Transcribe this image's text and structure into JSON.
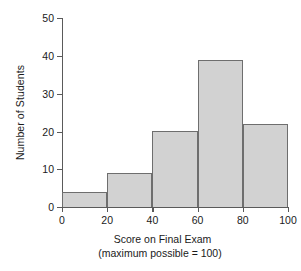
{
  "chart_data": {
    "type": "bar",
    "title": "",
    "subtitle": "",
    "xlabel": "Score on Final Exam",
    "xsublabel": "(maximum possible = 100)",
    "ylabel": "Number of Students",
    "categories": [
      "0-20",
      "20-40",
      "40-60",
      "60-80",
      "80-100"
    ],
    "bin_edges": [
      0,
      20,
      40,
      60,
      80,
      100
    ],
    "values": [
      4,
      9,
      20,
      39,
      22
    ],
    "xlim": [
      0,
      100
    ],
    "ylim": [
      0,
      50
    ],
    "xticks": [
      0,
      20,
      40,
      60,
      80,
      100
    ],
    "yticks": [
      0,
      10,
      20,
      30,
      40,
      50
    ],
    "grid": false,
    "legend": null,
    "bar_fill_color": "#d2d2d2",
    "bar_edge_color": "#6e6e6e",
    "axis_color": "#5a5a5a",
    "background_color": "#ffffff"
  },
  "axis_labels": {
    "y": [
      "50",
      "40",
      "30",
      "20",
      "10",
      "0"
    ],
    "x": [
      "0",
      "20",
      "40",
      "60",
      "80",
      "100"
    ]
  }
}
